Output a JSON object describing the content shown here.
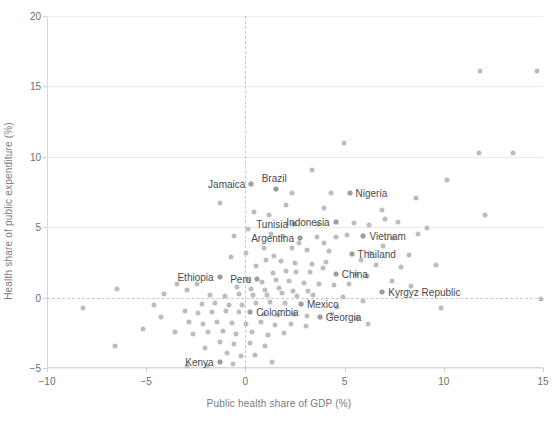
{
  "chart_data": {
    "type": "scatter",
    "title": "",
    "xlabel": "Public health share of GDP (%)",
    "ylabel": "Health share of public expenditure (%)",
    "xlim": [
      -10,
      15
    ],
    "ylim": [
      -5,
      20
    ],
    "xticks": [
      -10,
      -5,
      0,
      5,
      10,
      15
    ],
    "xticklabels": [
      "−10",
      "−5",
      "0",
      "5",
      "10",
      "15"
    ],
    "yticks": [
      -5,
      0,
      5,
      10,
      15,
      20
    ],
    "yticklabels": [
      "−5",
      "0",
      "5",
      "10",
      "15",
      "20"
    ],
    "grid": "horizontal",
    "legend": "none",
    "reference_lines": [
      {
        "axis": "y",
        "value": 0,
        "style": "dashed"
      },
      {
        "axis": "x",
        "value": 0,
        "style": "dashed"
      }
    ],
    "point_color": "#bdbdbd",
    "labeled_points": [
      {
        "label": "Jamaica",
        "x": 0.3,
        "y": 8.05,
        "side": "left"
      },
      {
        "label": "Brazil",
        "x": 1.55,
        "y": 7.7,
        "side": "above"
      },
      {
        "label": "Nigeria",
        "x": 5.25,
        "y": 7.45,
        "side": "right"
      },
      {
        "label": "Tunisia",
        "x": 2.45,
        "y": 5.25,
        "side": "left"
      },
      {
        "label": "Indonesia",
        "x": 4.55,
        "y": 5.35,
        "side": "left"
      },
      {
        "label": "Argentina",
        "x": 2.75,
        "y": 4.25,
        "side": "left"
      },
      {
        "label": "Vietnam",
        "x": 5.95,
        "y": 4.35,
        "side": "right"
      },
      {
        "label": "Thailand",
        "x": 5.35,
        "y": 3.1,
        "side": "right"
      },
      {
        "label": "Ethiopia",
        "x": -1.3,
        "y": 1.45,
        "side": "left"
      },
      {
        "label": "Peru",
        "x": 0.6,
        "y": 1.35,
        "side": "left"
      },
      {
        "label": "China",
        "x": 4.55,
        "y": 1.7,
        "side": "right"
      },
      {
        "label": "Kyrgyz Republic",
        "x": 6.9,
        "y": 0.4,
        "side": "right"
      },
      {
        "label": "Mexico",
        "x": 2.8,
        "y": -0.45,
        "side": "right"
      },
      {
        "label": "Colombia",
        "x": 0.25,
        "y": -1.05,
        "side": "right"
      },
      {
        "label": "Georgia",
        "x": 3.75,
        "y": -1.35,
        "side": "right"
      },
      {
        "label": "Kenya",
        "x": -1.3,
        "y": -4.55,
        "side": "left"
      }
    ],
    "points": [
      [
        11.8,
        16.1
      ],
      [
        14.7,
        16.1
      ],
      [
        4.95,
        11.0
      ],
      [
        11.75,
        10.3
      ],
      [
        13.5,
        10.25
      ],
      [
        3.35,
        9.05
      ],
      [
        10.15,
        8.35
      ],
      [
        0.3,
        8.05
      ],
      [
        1.55,
        7.7
      ],
      [
        2.35,
        7.4
      ],
      [
        4.3,
        7.45
      ],
      [
        5.25,
        7.45
      ],
      [
        8.6,
        7.1
      ],
      [
        12.1,
        5.85
      ],
      [
        -1.3,
        6.75
      ],
      [
        0.45,
        6.1
      ],
      [
        2.45,
        5.25
      ],
      [
        3.65,
        5.2
      ],
      [
        4.55,
        5.35
      ],
      [
        5.45,
        5.3
      ],
      [
        6.25,
        5.15
      ],
      [
        7.05,
        5.55
      ],
      [
        1.3,
        4.55
      ],
      [
        1.9,
        4.4
      ],
      [
        2.75,
        4.25
      ],
      [
        3.6,
        4.3
      ],
      [
        4.55,
        4.3
      ],
      [
        5.1,
        4.45
      ],
      [
        5.95,
        4.35
      ],
      [
        7.45,
        4.25
      ],
      [
        8.7,
        4.55
      ],
      [
        0.95,
        3.55
      ],
      [
        2.35,
        3.5
      ],
      [
        3.1,
        3.35
      ],
      [
        4.2,
        3.3
      ],
      [
        5.35,
        3.1
      ],
      [
        6.3,
        3.2
      ],
      [
        8.25,
        3.0
      ],
      [
        0.05,
        3.2
      ],
      [
        -0.75,
        2.85
      ],
      [
        1.05,
        2.7
      ],
      [
        1.8,
        2.6
      ],
      [
        2.5,
        2.45
      ],
      [
        3.35,
        2.4
      ],
      [
        4.05,
        2.55
      ],
      [
        6.6,
        2.3
      ],
      [
        7.85,
        2.15
      ],
      [
        9.6,
        2.3
      ],
      [
        -1.3,
        1.45
      ],
      [
        0.6,
        1.35
      ],
      [
        1.4,
        1.75
      ],
      [
        2.05,
        1.9
      ],
      [
        2.55,
        1.8
      ],
      [
        3.25,
        1.85
      ],
      [
        4.55,
        1.7
      ],
      [
        5.55,
        1.65
      ],
      [
        6.15,
        1.5
      ],
      [
        0.15,
        1.3
      ],
      [
        0.85,
        1.1
      ],
      [
        1.55,
        1.25
      ],
      [
        2.2,
        1.2
      ],
      [
        2.95,
        1.05
      ],
      [
        3.7,
        0.95
      ],
      [
        4.45,
        0.9
      ],
      [
        5.2,
        1.0
      ],
      [
        -2.45,
        1.0
      ],
      [
        -2.95,
        0.55
      ],
      [
        -0.4,
        0.75
      ],
      [
        0.3,
        0.6
      ],
      [
        1.0,
        0.55
      ],
      [
        1.7,
        0.7
      ],
      [
        2.4,
        0.5
      ],
      [
        3.15,
        0.45
      ],
      [
        6.9,
        0.4
      ],
      [
        -6.45,
        0.6
      ],
      [
        -8.2,
        -0.75
      ],
      [
        -1.8,
        0.2
      ],
      [
        -1.05,
        0.1
      ],
      [
        -0.3,
        0.25
      ],
      [
        0.4,
        0.15
      ],
      [
        1.1,
        0.2
      ],
      [
        1.85,
        0.3
      ],
      [
        2.6,
        0.1
      ],
      [
        3.4,
        0.2
      ],
      [
        4.9,
        0.05
      ],
      [
        14.9,
        -0.1
      ],
      [
        -2.2,
        -0.45
      ],
      [
        -1.55,
        -0.4
      ],
      [
        -0.85,
        -0.55
      ],
      [
        -0.15,
        -0.5
      ],
      [
        0.55,
        -0.35
      ],
      [
        1.25,
        -0.3
      ],
      [
        2.0,
        -0.4
      ],
      [
        2.8,
        -0.45
      ],
      [
        9.85,
        -0.75
      ],
      [
        -3.05,
        -0.95
      ],
      [
        -2.4,
        -1.1
      ],
      [
        -1.7,
        -1.05
      ],
      [
        -1.0,
        -0.95
      ],
      [
        -0.3,
        -1.05
      ],
      [
        0.25,
        -1.05
      ],
      [
        0.95,
        -1.15
      ],
      [
        1.65,
        -1.25
      ],
      [
        2.45,
        -1.2
      ],
      [
        3.1,
        -1.3
      ],
      [
        3.75,
        -1.35
      ],
      [
        4.35,
        -1.15
      ],
      [
        5.6,
        -1.45
      ],
      [
        -2.85,
        -1.75
      ],
      [
        -2.15,
        -1.85
      ],
      [
        -1.45,
        -1.7
      ],
      [
        -0.7,
        -1.8
      ],
      [
        0.05,
        -1.9
      ],
      [
        0.8,
        -1.75
      ],
      [
        1.5,
        -1.95
      ],
      [
        2.3,
        -1.85
      ],
      [
        3.05,
        -2.05
      ],
      [
        6.2,
        -1.9
      ],
      [
        -4.25,
        -1.4
      ],
      [
        -5.15,
        -2.2
      ],
      [
        -3.55,
        -2.45
      ],
      [
        -2.65,
        -2.6
      ],
      [
        -1.9,
        -2.45
      ],
      [
        -1.15,
        -2.35
      ],
      [
        -0.45,
        -2.55
      ],
      [
        0.35,
        -2.45
      ],
      [
        1.15,
        -2.65
      ],
      [
        1.95,
        -2.5
      ],
      [
        -1.3,
        -3.15
      ],
      [
        -0.55,
        -3.3
      ],
      [
        0.25,
        -3.2
      ],
      [
        1.0,
        -3.45
      ],
      [
        -6.55,
        -3.45
      ],
      [
        -2.05,
        -3.6
      ],
      [
        -0.95,
        -3.95
      ],
      [
        -0.2,
        -4.15
      ],
      [
        0.5,
        -4.05
      ],
      [
        1.35,
        -4.55
      ],
      [
        -1.3,
        -4.55
      ],
      [
        -2.95,
        -4.85
      ],
      [
        -1.95,
        -4.85
      ],
      [
        -0.65,
        -4.7
      ],
      [
        3.95,
        6.35
      ],
      [
        2.05,
        6.55
      ],
      [
        6.9,
        6.25
      ],
      [
        1.2,
        5.85
      ],
      [
        7.7,
        5.4
      ],
      [
        9.15,
        4.95
      ],
      [
        0.15,
        4.9
      ],
      [
        -0.55,
        4.35
      ],
      [
        3.95,
        3.85
      ],
      [
        2.7,
        3.9
      ],
      [
        6.95,
        3.7
      ],
      [
        1.45,
        2.95
      ],
      [
        5.85,
        2.7
      ],
      [
        0.55,
        2.25
      ],
      [
        3.9,
        2.1
      ],
      [
        7.4,
        1.15
      ],
      [
        8.35,
        0.85
      ],
      [
        -3.45,
        0.95
      ],
      [
        -4.1,
        0.25
      ],
      [
        5.95,
        -0.25
      ],
      [
        4.6,
        -0.65
      ],
      [
        -4.6,
        -0.55
      ]
    ]
  }
}
